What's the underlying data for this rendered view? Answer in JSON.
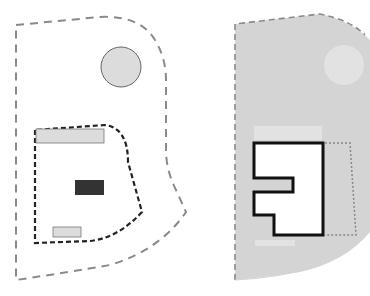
{
  "diagram": {
    "type": "site-plan-comparison",
    "panels": [
      {
        "id": "existing-site",
        "description": "Site boundary (dashed) containing a circular element, a dashed building footprint zone with two light rectangles and one dark rectangle",
        "elements": [
          {
            "kind": "site-boundary",
            "style": "dashed",
            "color": "#8a8a8a"
          },
          {
            "kind": "circle",
            "fill": "#dcdcdc",
            "stroke": "#666666"
          },
          {
            "kind": "buildable-zone",
            "style": "dashed",
            "color": "#222222"
          },
          {
            "kind": "rect-light-top",
            "fill": "#dcdcdc"
          },
          {
            "kind": "rect-dark-center",
            "fill": "#333333"
          },
          {
            "kind": "rect-light-bottom",
            "fill": "#dcdcdc"
          }
        ]
      },
      {
        "id": "proposed-site",
        "description": "Gray-filled site with faded circle, bold outlined building footprint and dotted extension zone",
        "elements": [
          {
            "kind": "site-fill",
            "fill": "#d4d4d4",
            "boundary_style": "dashed"
          },
          {
            "kind": "faded-circle",
            "fill": "#e2e2e2"
          },
          {
            "kind": "faded-rect-top",
            "fill": "#e2e2e2"
          },
          {
            "kind": "building-footprint",
            "fill": "#ffffff",
            "stroke": "#111111"
          },
          {
            "kind": "extension-zone",
            "style": "dotted",
            "color": "#888888"
          },
          {
            "kind": "faded-rect-bottom",
            "fill": "#e2e2e2"
          }
        ]
      }
    ]
  },
  "colors": {
    "background": "#ffffff",
    "site_gray": "#d4d4d4",
    "light_fill": "#dcdcdc",
    "dark_fill": "#333333",
    "dashed_gray": "#8a8a8a",
    "outline_black": "#111111"
  }
}
